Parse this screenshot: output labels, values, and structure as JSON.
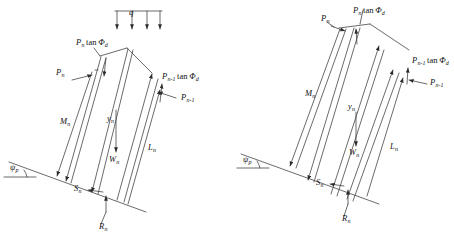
{
  "figure": {
    "background_color": "#ffffff",
    "line_color": "#3a3a3a",
    "text_color": "#111111"
  },
  "panels": [
    {
      "id": "left",
      "name": "slice-with-surcharge",
      "has_surcharge_load": true,
      "surcharge": {
        "symbol": "q",
        "arrow_count": 4,
        "name": "distributed-surcharge-load"
      },
      "caption": "",
      "labels": {
        "interslice_top_shear": {
          "base": "P",
          "sub": "n",
          "tail": "tan",
          "greek": "Φ",
          "greek_sub": "d",
          "text": "Pₙ tan Φₔ"
        },
        "interslice_top_normal": {
          "base": "P",
          "sub": "n",
          "text": "Pₙ"
        },
        "interslice_bottom_shear": {
          "base": "P",
          "sub": "n-1",
          "tail": "tan",
          "greek": "Φ",
          "greek_sub": "d",
          "text": "Pₙ₋₁ tan Φₔ"
        },
        "interslice_bottom_normal": {
          "base": "P",
          "sub": "n-1",
          "text": "Pₙ₋₁"
        },
        "upper_slice_length": {
          "base": "M",
          "sub": "n",
          "text": "Mₙ"
        },
        "moment_arm": {
          "base": "y",
          "sub": "n",
          "text": "yₙ"
        },
        "slice_weight": {
          "base": "W",
          "sub": "n",
          "text": "Wₙ"
        },
        "lower_slice_length": {
          "base": "L",
          "sub": "n",
          "text": "Lₙ"
        },
        "shear_resistance": {
          "base": "S",
          "sub": "n",
          "text": "Sₙ"
        },
        "normal_reaction": {
          "base": "R",
          "sub": "n",
          "text": "Rₙ"
        },
        "slope_angle": {
          "base": "ψ",
          "sub": "p",
          "text": "ψₚ"
        }
      }
    },
    {
      "id": "right",
      "name": "slice-without-surcharge",
      "has_surcharge_load": false,
      "caption": "",
      "labels": {
        "interslice_top_shear": {
          "base": "P",
          "sub": "n",
          "tail": "tan",
          "greek": "Φ",
          "greek_sub": "d",
          "text": "Pₙ tan Φₔ"
        },
        "interslice_top_normal": {
          "base": "P",
          "sub": "n",
          "text": "Pₙ"
        },
        "interslice_bottom_shear": {
          "base": "P",
          "sub": "n-1",
          "tail": "tan",
          "greek": "Φ",
          "greek_sub": "d",
          "text": "Pₙ₋₁ tan Φₔ"
        },
        "interslice_bottom_normal": {
          "base": "P",
          "sub": "n-1",
          "text": "Pₙ₋₁"
        },
        "upper_slice_length": {
          "base": "M",
          "sub": "n",
          "text": "Mₙ"
        },
        "moment_arm": {
          "base": "y",
          "sub": "n",
          "text": "yₙ"
        },
        "slice_weight": {
          "base": "W",
          "sub": "n",
          "text": "Wₙ"
        },
        "lower_slice_length": {
          "base": "L",
          "sub": "n",
          "text": "Lₙ"
        },
        "shear_resistance": {
          "base": "S",
          "sub": "n",
          "text": "Sₙ"
        },
        "normal_reaction": {
          "base": "R",
          "sub": "n",
          "text": "Rₙ"
        },
        "slope_angle": {
          "base": "ψ",
          "sub": "p",
          "text": "ψₚ"
        }
      }
    }
  ],
  "symbols": {
    "q": "q",
    "tan": "tan",
    "phi": "Φ",
    "phi_sub": "d",
    "psi": "ψ",
    "psi_sub": "p",
    "sub_n": "n",
    "sub_n_minus_1": "n–1",
    "P": "P",
    "M": "M",
    "L": "L",
    "S": "S",
    "R": "R",
    "W": "W",
    "y": "y"
  }
}
